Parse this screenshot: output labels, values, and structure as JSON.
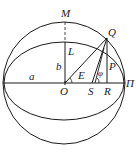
{
  "diagram": {
    "type": "geometry",
    "labels": {
      "M": "M",
      "Q": "Q",
      "L": "L",
      "b": "b",
      "a": "a",
      "E": "E",
      "P": "P",
      "phi": "φ",
      "O": "O",
      "S": "S",
      "R": "R",
      "Pi": "Π"
    },
    "colors": {
      "stroke": "#1a1a1a",
      "background": "#ffffff"
    }
  }
}
